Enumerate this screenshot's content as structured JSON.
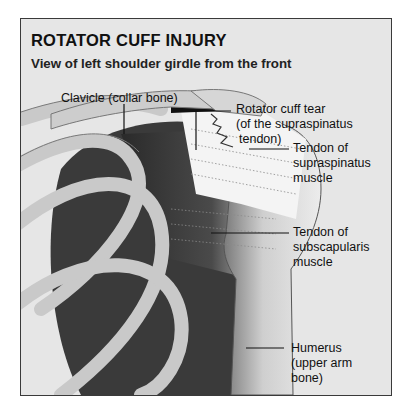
{
  "figure": {
    "title": "ROTATOR CUFF INJURY",
    "subtitle": "View of left shoulder girdle from the front"
  },
  "labels": {
    "clavicle": "Clavicle (collar bone)",
    "tear_line1": "Rotator cuff tear",
    "tear_line2": "(of the supraspinatus",
    "tear_line3": "tendon)",
    "supra_line1": "Tendon of",
    "supra_line2": "supraspinatus",
    "supra_line3": "muscle",
    "subscap_line1": "Tendon of",
    "subscap_line2": "subscapularis",
    "subscap_line3": "muscle",
    "humerus_line1": "Humerus",
    "humerus_line2": "(upper arm",
    "humerus_line3": "bone)"
  },
  "colors": {
    "frame_bg": "#e6e6e6",
    "bone": "#c8c8c8",
    "shadow": "#3c3c3c",
    "tendon": "#f2f2f2"
  }
}
